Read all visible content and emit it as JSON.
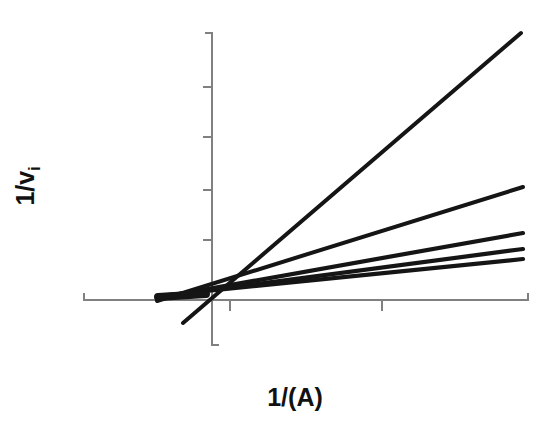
{
  "chart_data": {
    "type": "line",
    "title": "",
    "subtitle": "",
    "xlabel": "1/(A)",
    "xlabel_text": "1/(A)",
    "ylabel": "1/vi",
    "ylabel_main": "1/v",
    "ylabel_sub": "i",
    "grid": false,
    "legend": null,
    "legend_position": "none",
    "axis_tick_labels_x": [],
    "axis_tick_labels_y": [],
    "xlim": [
      -0.6,
      3.4
    ],
    "ylim": [
      -0.35,
      2.6
    ],
    "x_tick_values": [
      0,
      1,
      2,
      3
    ],
    "y_tick_values": [
      0,
      0.5,
      1.0,
      1.5,
      2.0,
      2.5
    ],
    "common_intersection": {
      "x": -0.12,
      "y": 0.05
    },
    "series": [
      {
        "name": "line-1",
        "slope": 0.745,
        "intercept": 0.139,
        "x_start": -0.22,
        "x_end": 3.0,
        "y_start": -0.025,
        "y_end": 2.375
      },
      {
        "name": "line-2",
        "slope": 0.359,
        "intercept": 0.093,
        "x_start": -0.45,
        "x_end": 3.08,
        "y_start": -0.069,
        "y_end": 1.198
      },
      {
        "name": "line-3",
        "slope": 0.212,
        "intercept": 0.075,
        "x_start": -0.45,
        "x_end": 3.08,
        "y_start": -0.021,
        "y_end": 0.728
      },
      {
        "name": "line-4",
        "slope": 0.157,
        "intercept": 0.069,
        "x_start": -0.45,
        "x_end": 3.08,
        "y_start": -0.002,
        "y_end": 0.553
      },
      {
        "name": "line-5",
        "slope": 0.132,
        "intercept": 0.066,
        "x_start": -0.45,
        "x_end": 3.08,
        "y_start": 0.007,
        "y_end": 0.473
      }
    ],
    "series_pixel_paths": [
      {
        "name": "line-1",
        "x1": 183,
        "y1": 323,
        "x2": 521,
        "y2": 33,
        "width": 4.0
      },
      {
        "name": "line-2",
        "x1": 157,
        "y1": 301,
        "x2": 523,
        "y2": 187,
        "width": 4.0
      },
      {
        "name": "line-3",
        "x1": 157,
        "y1": 298,
        "x2": 523,
        "y2": 233,
        "width": 4.2
      },
      {
        "name": "line-4",
        "x1": 157,
        "y1": 297,
        "x2": 523,
        "y2": 249,
        "width": 4.2
      },
      {
        "name": "line-5",
        "x1": 157,
        "y1": 296,
        "x2": 523,
        "y2": 259,
        "width": 4.2
      }
    ],
    "axes_pixels": {
      "x_axis": {
        "x1": 84,
        "y": 300,
        "x2": 528
      },
      "y_axis": {
        "x": 212,
        "y1": 33,
        "y2": 345
      },
      "x_ticks": [
        230,
        382
      ],
      "x_end_feet": [
        84,
        528
      ],
      "y_ticks": [
        33,
        87,
        137,
        190,
        240
      ],
      "y_foot": 345
    },
    "colors": {
      "background": "#ffffff",
      "axis": "#808080",
      "line": "#151515",
      "label_text": "#111111"
    }
  }
}
